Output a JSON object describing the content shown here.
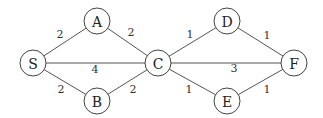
{
  "graph": {
    "type": "weighted-undirected-graph",
    "nodes": [
      {
        "id": "S",
        "label": "S",
        "x": 33,
        "y": 63
      },
      {
        "id": "A",
        "label": "A",
        "x": 97,
        "y": 21
      },
      {
        "id": "B",
        "label": "B",
        "x": 97,
        "y": 101
      },
      {
        "id": "C",
        "label": "C",
        "x": 158,
        "y": 63
      },
      {
        "id": "D",
        "label": "D",
        "x": 227,
        "y": 21
      },
      {
        "id": "E",
        "label": "E",
        "x": 227,
        "y": 101
      },
      {
        "id": "F",
        "label": "F",
        "x": 294,
        "y": 63
      }
    ],
    "edges": [
      {
        "from": "S",
        "to": "A",
        "weight": "2",
        "lx": 60,
        "ly": 34
      },
      {
        "from": "A",
        "to": "C",
        "weight": "2",
        "lx": 131,
        "ly": 32
      },
      {
        "from": "S",
        "to": "C",
        "weight": "4",
        "lx": 95,
        "ly": 69
      },
      {
        "from": "S",
        "to": "B",
        "weight": "2",
        "lx": 61,
        "ly": 89
      },
      {
        "from": "B",
        "to": "C",
        "weight": "2",
        "lx": 133,
        "ly": 89
      },
      {
        "from": "C",
        "to": "D",
        "weight": "1",
        "lx": 190,
        "ly": 34
      },
      {
        "from": "D",
        "to": "F",
        "weight": "1",
        "lx": 267,
        "ly": 35
      },
      {
        "from": "C",
        "to": "F",
        "weight": "3",
        "lx": 234,
        "ly": 68
      },
      {
        "from": "C",
        "to": "E",
        "weight": "1",
        "lx": 189,
        "ly": 89
      },
      {
        "from": "E",
        "to": "F",
        "weight": "1",
        "lx": 267,
        "ly": 89
      }
    ],
    "node_radius": 13
  }
}
